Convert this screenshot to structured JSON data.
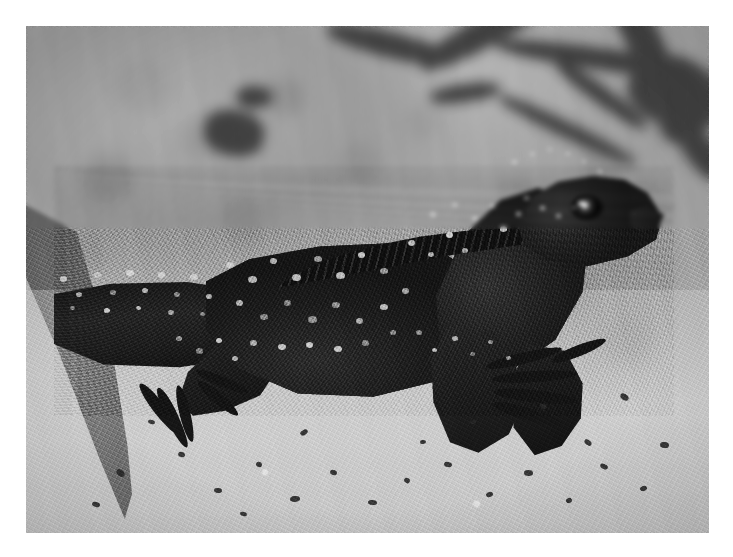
{
  "image": {
    "kind": "photograph",
    "color_mode": "black-and-white",
    "subject": "lizard",
    "subject_detail": "spiny-tailed lizard standing on sand, facing right",
    "scene": "sandy ground with blurred twigs in background",
    "frame": {
      "border_color": "#ffffff",
      "content_left": 26,
      "content_top": 26,
      "content_width": 683,
      "content_height": 507
    },
    "palette": {
      "background_sand_mid": "#a5a5a5",
      "foreground_sand_light": "#c6c6c6",
      "sand_highlight": "#d4d4d4",
      "lizard_dark": "#1e1e1e",
      "lizard_scale_spot": "#d6d6d6",
      "twig_dark": "#3f3f3f",
      "leaf_shadow": "#5c5c5c",
      "eye_pupil": "#0d0d0d",
      "eye_glint": "#e6e6e6"
    },
    "elements": [
      {
        "name": "blurred-twigs",
        "region": "top",
        "tone": "dark"
      },
      {
        "name": "leaf-shadow-wedge",
        "region": "left-edge",
        "tone": "mid-dark"
      },
      {
        "name": "lizard-tail",
        "region": "left",
        "tone": "dark"
      },
      {
        "name": "lizard-torso",
        "region": "center",
        "tone": "dark-with-light-spots"
      },
      {
        "name": "dorsal-crest",
        "region": "upper-center",
        "tone": "very-dark-serrated"
      },
      {
        "name": "lizard-head",
        "region": "upper-right",
        "tone": "dark"
      },
      {
        "name": "lizard-eye",
        "region": "upper-right",
        "tone": "highlight"
      },
      {
        "name": "front-foot",
        "region": "lower-right-center",
        "tone": "dark-splayed-toes"
      },
      {
        "name": "rear-foot",
        "region": "lower-left",
        "tone": "dark-splayed-toes"
      },
      {
        "name": "sand-foreground",
        "region": "bottom",
        "tone": "light-speckled"
      }
    ]
  },
  "twigs": [
    {
      "x": 386,
      "y": -10,
      "w": 150,
      "h": 30,
      "rot": -28
    },
    {
      "x": 300,
      "y": 6,
      "w": 130,
      "h": 26,
      "rot": 14
    },
    {
      "x": 470,
      "y": 22,
      "w": 210,
      "h": 22,
      "rot": 8
    },
    {
      "x": 556,
      "y": -6,
      "w": 120,
      "h": 34,
      "rot": 62
    },
    {
      "x": 602,
      "y": 30,
      "w": 90,
      "h": 70,
      "rot": 20
    },
    {
      "x": 630,
      "y": 66,
      "w": 70,
      "h": 44,
      "rot": -40
    },
    {
      "x": 520,
      "y": 60,
      "w": 110,
      "h": 18,
      "rot": 36
    },
    {
      "x": 404,
      "y": 58,
      "w": 70,
      "h": 18,
      "rot": -8
    },
    {
      "x": 178,
      "y": 84,
      "w": 60,
      "h": 46,
      "rot": 12
    },
    {
      "x": 210,
      "y": 60,
      "w": 36,
      "h": 22,
      "rot": 0
    },
    {
      "x": 644,
      "y": 112,
      "w": 64,
      "h": 30,
      "rot": 52
    },
    {
      "x": 466,
      "y": 96,
      "w": 150,
      "h": 16,
      "rot": 26
    }
  ],
  "spots": [
    {
      "x": 60,
      "y": 276,
      "r": 7
    },
    {
      "x": 76,
      "y": 292,
      "r": 6
    },
    {
      "x": 94,
      "y": 272,
      "r": 7
    },
    {
      "x": 110,
      "y": 290,
      "r": 6
    },
    {
      "x": 126,
      "y": 270,
      "r": 8
    },
    {
      "x": 142,
      "y": 288,
      "r": 6
    },
    {
      "x": 158,
      "y": 272,
      "r": 7
    },
    {
      "x": 174,
      "y": 292,
      "r": 6
    },
    {
      "x": 190,
      "y": 274,
      "r": 8
    },
    {
      "x": 206,
      "y": 294,
      "r": 6
    },
    {
      "x": 70,
      "y": 306,
      "r": 5
    },
    {
      "x": 104,
      "y": 308,
      "r": 6
    },
    {
      "x": 136,
      "y": 306,
      "r": 5
    },
    {
      "x": 168,
      "y": 310,
      "r": 6
    },
    {
      "x": 200,
      "y": 312,
      "r": 5
    },
    {
      "x": 226,
      "y": 262,
      "r": 8
    },
    {
      "x": 248,
      "y": 276,
      "r": 9
    },
    {
      "x": 270,
      "y": 258,
      "r": 7
    },
    {
      "x": 292,
      "y": 274,
      "r": 9
    },
    {
      "x": 314,
      "y": 256,
      "r": 8
    },
    {
      "x": 336,
      "y": 272,
      "r": 9
    },
    {
      "x": 358,
      "y": 252,
      "r": 7
    },
    {
      "x": 380,
      "y": 268,
      "r": 8
    },
    {
      "x": 236,
      "y": 300,
      "r": 7
    },
    {
      "x": 260,
      "y": 314,
      "r": 8
    },
    {
      "x": 284,
      "y": 300,
      "r": 7
    },
    {
      "x": 308,
      "y": 316,
      "r": 9
    },
    {
      "x": 332,
      "y": 302,
      "r": 8
    },
    {
      "x": 356,
      "y": 318,
      "r": 7
    },
    {
      "x": 380,
      "y": 304,
      "r": 8
    },
    {
      "x": 402,
      "y": 288,
      "r": 7
    },
    {
      "x": 250,
      "y": 340,
      "r": 7
    },
    {
      "x": 278,
      "y": 344,
      "r": 8
    },
    {
      "x": 306,
      "y": 342,
      "r": 7
    },
    {
      "x": 334,
      "y": 346,
      "r": 8
    },
    {
      "x": 362,
      "y": 340,
      "r": 7
    },
    {
      "x": 390,
      "y": 330,
      "r": 6
    },
    {
      "x": 408,
      "y": 240,
      "r": 7
    },
    {
      "x": 428,
      "y": 252,
      "r": 6
    },
    {
      "x": 446,
      "y": 232,
      "r": 7
    },
    {
      "x": 462,
      "y": 248,
      "r": 6
    },
    {
      "x": 430,
      "y": 212,
      "r": 6
    },
    {
      "x": 452,
      "y": 202,
      "r": 6
    },
    {
      "x": 472,
      "y": 216,
      "r": 6
    },
    {
      "x": 490,
      "y": 204,
      "r": 5
    },
    {
      "x": 500,
      "y": 226,
      "r": 7
    },
    {
      "x": 516,
      "y": 212,
      "r": 5
    },
    {
      "x": 512,
      "y": 160,
      "r": 5
    },
    {
      "x": 530,
      "y": 152,
      "r": 5
    },
    {
      "x": 548,
      "y": 148,
      "r": 4
    },
    {
      "x": 566,
      "y": 152,
      "r": 4
    },
    {
      "x": 582,
      "y": 160,
      "r": 4
    },
    {
      "x": 598,
      "y": 170,
      "r": 4
    },
    {
      "x": 524,
      "y": 196,
      "r": 5
    },
    {
      "x": 540,
      "y": 206,
      "r": 5
    },
    {
      "x": 556,
      "y": 214,
      "r": 5
    },
    {
      "x": 572,
      "y": 206,
      "r": 4
    },
    {
      "x": 416,
      "y": 330,
      "r": 6
    },
    {
      "x": 432,
      "y": 348,
      "r": 5
    },
    {
      "x": 452,
      "y": 336,
      "r": 6
    },
    {
      "x": 470,
      "y": 352,
      "r": 5
    },
    {
      "x": 488,
      "y": 340,
      "r": 5
    },
    {
      "x": 506,
      "y": 356,
      "r": 5
    },
    {
      "x": 176,
      "y": 336,
      "r": 6
    },
    {
      "x": 196,
      "y": 348,
      "r": 7
    },
    {
      "x": 216,
      "y": 338,
      "r": 6
    },
    {
      "x": 232,
      "y": 356,
      "r": 6
    }
  ],
  "debris": [
    {
      "x": 116,
      "y": 470,
      "w": 9,
      "h": 6
    },
    {
      "x": 178,
      "y": 452,
      "w": 7,
      "h": 5
    },
    {
      "x": 214,
      "y": 488,
      "w": 8,
      "h": 5
    },
    {
      "x": 256,
      "y": 462,
      "w": 6,
      "h": 5
    },
    {
      "x": 290,
      "y": 496,
      "w": 10,
      "h": 6
    },
    {
      "x": 330,
      "y": 470,
      "w": 7,
      "h": 5
    },
    {
      "x": 368,
      "y": 500,
      "w": 9,
      "h": 5
    },
    {
      "x": 404,
      "y": 478,
      "w": 6,
      "h": 5
    },
    {
      "x": 444,
      "y": 462,
      "w": 8,
      "h": 5
    },
    {
      "x": 486,
      "y": 492,
      "w": 7,
      "h": 5
    },
    {
      "x": 524,
      "y": 470,
      "w": 9,
      "h": 6
    },
    {
      "x": 566,
      "y": 498,
      "w": 6,
      "h": 5
    },
    {
      "x": 600,
      "y": 464,
      "w": 8,
      "h": 5
    },
    {
      "x": 640,
      "y": 486,
      "w": 7,
      "h": 5
    },
    {
      "x": 660,
      "y": 442,
      "w": 9,
      "h": 6
    },
    {
      "x": 148,
      "y": 420,
      "w": 7,
      "h": 4
    },
    {
      "x": 300,
      "y": 430,
      "w": 8,
      "h": 5
    },
    {
      "x": 540,
      "y": 404,
      "w": 7,
      "h": 5
    },
    {
      "x": 620,
      "y": 394,
      "w": 9,
      "h": 6
    },
    {
      "x": 420,
      "y": 440,
      "w": 6,
      "h": 4
    },
    {
      "x": 92,
      "y": 502,
      "w": 8,
      "h": 5
    },
    {
      "x": 240,
      "y": 512,
      "w": 7,
      "h": 4
    },
    {
      "x": 470,
      "y": 420,
      "w": 6,
      "h": 4
    },
    {
      "x": 584,
      "y": 440,
      "w": 8,
      "h": 5
    }
  ],
  "toes_front": [
    {
      "x": 492,
      "y": 398,
      "w": 72,
      "h": 12,
      "rot": 16
    },
    {
      "x": 494,
      "y": 386,
      "w": 84,
      "h": 12,
      "rot": 6
    },
    {
      "x": 492,
      "y": 374,
      "w": 86,
      "h": 11,
      "rot": -4
    },
    {
      "x": 486,
      "y": 362,
      "w": 78,
      "h": 11,
      "rot": -14
    },
    {
      "x": 552,
      "y": 356,
      "w": 58,
      "h": 11,
      "rot": -22
    }
  ],
  "toes_rear": [
    {
      "x": 140,
      "y": 378,
      "w": 64,
      "h": 12,
      "rot": 52
    },
    {
      "x": 158,
      "y": 382,
      "w": 66,
      "h": 12,
      "rot": 64
    },
    {
      "x": 178,
      "y": 380,
      "w": 58,
      "h": 11,
      "rot": 76
    },
    {
      "x": 198,
      "y": 376,
      "w": 52,
      "h": 11,
      "rot": 40
    },
    {
      "x": 196,
      "y": 366,
      "w": 56,
      "h": 10,
      "rot": 22
    }
  ]
}
